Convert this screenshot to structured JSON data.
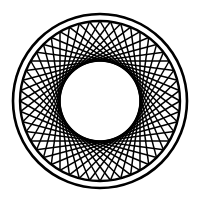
{
  "figure": {
    "width": 200,
    "height": 203,
    "background": "#ffffff",
    "stroke_color": "#000000",
    "center": [
      100,
      101
    ],
    "outer_ring": {
      "radius": 87,
      "stroke_width": 2.6
    },
    "inner_ring": {
      "radius": 80,
      "stroke_width": 2.4
    },
    "chord_pattern": {
      "points": 48,
      "step": 16,
      "radius": 80,
      "stroke_width": 1.5
    },
    "hole_radius": 40
  }
}
